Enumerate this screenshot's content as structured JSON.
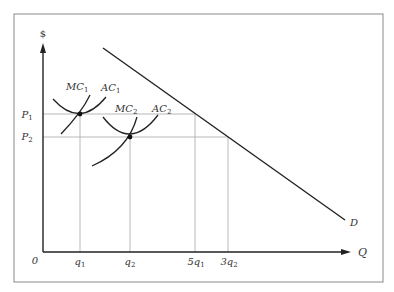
{
  "diagram": {
    "type": "economics-cost-demand",
    "axes": {
      "y_label": "$",
      "x_label": "Q",
      "origin_label": "0"
    },
    "price_levels": [
      {
        "label": "P",
        "sub": "1"
      },
      {
        "label": "P",
        "sub": "2"
      }
    ],
    "quantity_ticks": [
      {
        "label": "q",
        "sub": "1"
      },
      {
        "label": "q",
        "sub": "2"
      },
      {
        "label": "5q",
        "sub": "1"
      },
      {
        "label": "3q",
        "sub": "2"
      }
    ],
    "curves": {
      "mc1": {
        "label": "MC",
        "sub": "1"
      },
      "ac1": {
        "label": "AC",
        "sub": "1"
      },
      "mc2": {
        "label": "MC",
        "sub": "2"
      },
      "ac2": {
        "label": "AC",
        "sub": "2"
      },
      "demand": {
        "label": "D"
      }
    },
    "colors": {
      "curve": "#222222",
      "guide": "#b0b0b0",
      "frame": "#8a8a8a"
    }
  }
}
